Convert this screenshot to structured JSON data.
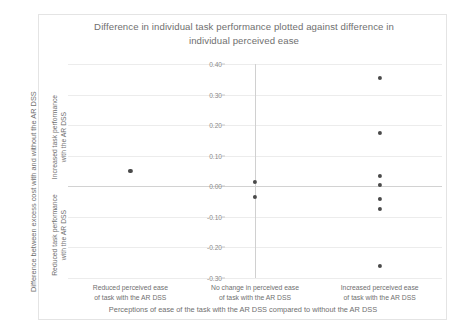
{
  "chart_data": {
    "type": "scatter",
    "title": "Difference in individual task performance plotted against difference in individual perceived ease",
    "title_lines": [
      "Difference in individual task performance plotted against difference in",
      "individual perceived ease"
    ],
    "xlabel": "Perceptions of ease of the task with the AR DSS compared to without the AR DSS",
    "ylabel": "Difference between excess cost with and without the AR DSS",
    "ylabel_segments": [
      {
        "name": "increased",
        "lines": [
          "Increased task performance",
          "with the AR DSS"
        ]
      },
      {
        "name": "reduced",
        "lines": [
          "Reduced task performance",
          "with the AR DSS"
        ]
      }
    ],
    "categories": [
      {
        "index": 1,
        "lines": [
          "Reduced perceived ease",
          "of task with the AR DSS"
        ]
      },
      {
        "index": 2,
        "lines": [
          "No change in perceived ease",
          "of task with the AR DSS"
        ]
      },
      {
        "index": 3,
        "lines": [
          "Increased perceived ease",
          "of task with the AR DSS"
        ]
      }
    ],
    "ylim": [
      -0.3,
      0.4
    ],
    "yticks": [
      0.4,
      0.3,
      0.2,
      0.1,
      0.0,
      -0.1,
      -0.2,
      -0.3
    ],
    "ytick_labels": [
      "0.40",
      "0.30",
      "0.20",
      "0.10",
      "0.00",
      "-0.10",
      "-0.20",
      "-0.30"
    ],
    "grid": true,
    "legend": false,
    "series": [
      {
        "name": "Individual participants",
        "points": [
          {
            "category": 1,
            "y": 0.05
          },
          {
            "category": 2,
            "y": 0.015
          },
          {
            "category": 2,
            "y": -0.035
          },
          {
            "category": 3,
            "y": 0.355
          },
          {
            "category": 3,
            "y": 0.175
          },
          {
            "category": 3,
            "y": 0.035
          },
          {
            "category": 3,
            "y": 0.005
          },
          {
            "category": 3,
            "y": -0.04
          },
          {
            "category": 3,
            "y": -0.075
          },
          {
            "category": 3,
            "y": -0.26
          }
        ]
      }
    ],
    "colors": {
      "marker": "#4a4a4a",
      "grid": "#ececec",
      "axis": "#d0d0d0",
      "text": "#6f6f6f",
      "tick_text": "#8a8a8a",
      "frame": "#e4e4e4",
      "background": "#ffffff"
    }
  }
}
